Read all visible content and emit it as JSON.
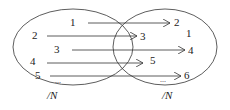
{
  "diagram": {
    "type": "mapping",
    "left_set": {
      "label": "/N",
      "elements": [
        "1",
        "2",
        "3",
        "4",
        "5",
        "..."
      ]
    },
    "right_set": {
      "label": "/N",
      "elements": [
        "2",
        "1",
        "3",
        "4",
        "5",
        "6",
        "..."
      ]
    },
    "arrows": [
      {
        "from": "1",
        "to": "2"
      },
      {
        "from": "2",
        "to": "3"
      },
      {
        "from": "3",
        "to": "4"
      },
      {
        "from": "4",
        "to": "5"
      },
      {
        "from": "5",
        "to": "6"
      }
    ],
    "colors": {
      "stroke": "#333333",
      "text": "#222222"
    }
  }
}
